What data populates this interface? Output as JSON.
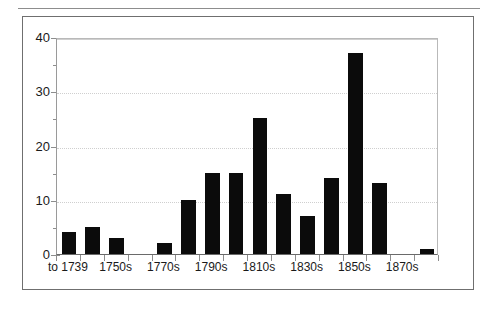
{
  "chart_data": {
    "type": "bar",
    "title": "",
    "subtitle": "",
    "xlabel": "",
    "ylabel": "",
    "categories": [
      "to 1739",
      "1740s",
      "1750s",
      "1760s",
      "1770s",
      "1780s",
      "1790s",
      "1800s",
      "1810s",
      "1820s",
      "1830s",
      "1840s",
      "1850s",
      "1860s",
      "1870s",
      "1880s"
    ],
    "tick_labels": [
      "to 1739",
      "",
      "1750s",
      "",
      "1770s",
      "",
      "1790s",
      "",
      "1810s",
      "",
      "1830s",
      "",
      "1850s",
      "",
      "1870s",
      ""
    ],
    "values": [
      4,
      5,
      3,
      0,
      2,
      10,
      15,
      15,
      25,
      11,
      7,
      14,
      37,
      13,
      0,
      1
    ],
    "ylim": [
      0,
      40
    ],
    "yticks_major": [
      0,
      10,
      20,
      30,
      40
    ],
    "yticks_minor": [
      5,
      15,
      25,
      35
    ],
    "ytick_labels": [
      "0",
      "10",
      "20",
      "30",
      "40"
    ],
    "grid": "horizontal-dotted",
    "legend": "none",
    "bar_color": "#0b0b0b",
    "gridline_color": "#cfcfcf",
    "axis_color": "#8d8d8d",
    "frame_color": "#6f6f6f"
  }
}
